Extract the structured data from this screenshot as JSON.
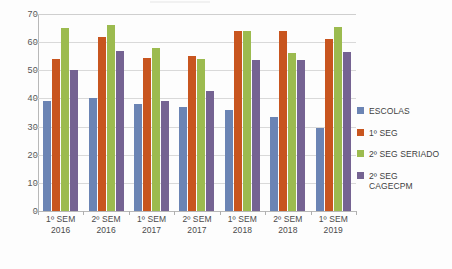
{
  "chart_data": {
    "type": "bar",
    "title": "",
    "xlabel": "",
    "ylabel": "",
    "ylim": [
      0,
      70
    ],
    "ytick_step": 10,
    "yticks": [
      0,
      10,
      20,
      30,
      40,
      50,
      60,
      70
    ],
    "grid": true,
    "legend_position": "right",
    "categories": [
      "1º SEM\n2016",
      "2º SEM\n2016",
      "1º SEM\n2017",
      "2º SEM\n2017",
      "1º SEM\n2018",
      "2º SEM\n2018",
      "1º SEM\n2019"
    ],
    "series": [
      {
        "name": "ESCOLAS",
        "color": "#6b84b4",
        "values": [
          39,
          40,
          38,
          37,
          36,
          33.5,
          29.5
        ]
      },
      {
        "name": "1º SEG",
        "color": "#c8551f",
        "values": [
          54,
          62,
          54.5,
          55,
          64,
          64,
          61
        ]
      },
      {
        "name": "2º SEG SERIADO",
        "color": "#9cbb4f",
        "values": [
          65,
          66,
          58,
          54,
          64,
          56,
          65.5
        ]
      },
      {
        "name": "2º SEG CAGECPM",
        "color": "#756392",
        "values": [
          50,
          57,
          39,
          42.5,
          53.5,
          53.5,
          56.5
        ]
      }
    ]
  },
  "legend": {
    "items": [
      {
        "label": "ESCOLAS"
      },
      {
        "label": "1º SEG"
      },
      {
        "label": "2º SEG SERIADO"
      },
      {
        "label": "2º SEG\nCAGECPM"
      }
    ]
  }
}
